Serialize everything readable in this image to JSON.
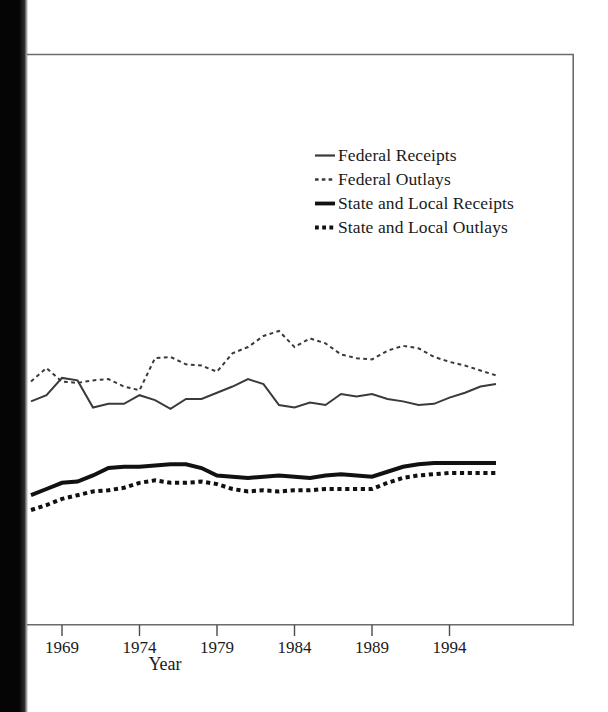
{
  "chart_data": {
    "type": "line",
    "title": "",
    "subtitle": "",
    "xlabel": "Year",
    "ylabel": "",
    "grid": false,
    "legend_position": "upper-center",
    "xlim": [
      1967,
      1998
    ],
    "ylim": [
      0,
      26
    ],
    "x_ticks": [
      1969,
      1974,
      1979,
      1984,
      1989,
      1994
    ],
    "x_tick_labels": [
      "1969",
      "1974",
      "1979",
      "1984",
      "1989",
      "1994"
    ],
    "y_ticks": [],
    "y_tick_labels": [],
    "note": "Y axis is cropped out of the screenshot; values are percent-of-GDP style magnitudes estimated from pixel positions.",
    "x": [
      1967,
      1968,
      1969,
      1970,
      1971,
      1972,
      1973,
      1974,
      1975,
      1976,
      1977,
      1978,
      1979,
      1980,
      1981,
      1982,
      1983,
      1984,
      1985,
      1986,
      1987,
      1988,
      1989,
      1990,
      1991,
      1992,
      1993,
      1994,
      1995,
      1996,
      1997
    ],
    "series": [
      {
        "name": "Federal Receipts",
        "style": "solid",
        "width": "thin",
        "color": "#3a3a3a",
        "values": [
          17.8,
          18.3,
          19.7,
          19.5,
          17.3,
          17.6,
          17.6,
          18.3,
          17.9,
          17.2,
          18.0,
          18.0,
          18.5,
          19.0,
          19.6,
          19.2,
          17.5,
          17.3,
          17.7,
          17.5,
          18.4,
          18.2,
          18.4,
          18.0,
          17.8,
          17.5,
          17.6,
          18.1,
          18.5,
          19.0,
          19.2
        ]
      },
      {
        "name": "Federal Outlays",
        "style": "dotted",
        "width": "thin",
        "color": "#3a3a3a",
        "values": [
          19.4,
          20.5,
          19.4,
          19.3,
          19.5,
          19.6,
          19.0,
          18.7,
          21.3,
          21.4,
          20.8,
          20.7,
          20.2,
          21.7,
          22.2,
          23.1,
          23.5,
          22.2,
          22.9,
          22.5,
          21.6,
          21.3,
          21.2,
          21.9,
          22.3,
          22.1,
          21.4,
          21.0,
          20.7,
          20.3,
          19.9
        ]
      },
      {
        "name": "State and Local Receipts",
        "style": "solid",
        "width": "thick",
        "color": "#111111",
        "values": [
          10.2,
          10.7,
          11.2,
          11.3,
          11.8,
          12.4,
          12.5,
          12.5,
          12.6,
          12.7,
          12.7,
          12.4,
          11.8,
          11.7,
          11.6,
          11.7,
          11.8,
          11.7,
          11.6,
          11.8,
          11.9,
          11.8,
          11.7,
          12.1,
          12.5,
          12.7,
          12.8,
          12.8,
          12.8,
          12.8,
          12.8
        ]
      },
      {
        "name": "State and Local Outlays",
        "style": "dotted",
        "width": "thick",
        "color": "#111111",
        "values": [
          9.0,
          9.4,
          9.9,
          10.2,
          10.5,
          10.6,
          10.8,
          11.2,
          11.4,
          11.2,
          11.2,
          11.3,
          11.1,
          10.7,
          10.5,
          10.6,
          10.5,
          10.6,
          10.6,
          10.7,
          10.7,
          10.7,
          10.7,
          11.2,
          11.6,
          11.8,
          11.9,
          12.0,
          12.0,
          12.0,
          12.0
        ]
      }
    ]
  },
  "legend": {
    "items": [
      {
        "label": "Federal Receipts",
        "style": "solid-thin"
      },
      {
        "label": "Federal Outlays",
        "style": "dotted-thin"
      },
      {
        "label": "State and Local Receipts",
        "style": "solid-thick"
      },
      {
        "label": "State and Local Outlays",
        "style": "dotted-thick"
      }
    ]
  },
  "axis": {
    "x_title": "Year",
    "x_tick_labels": [
      "1969",
      "1974",
      "1979",
      "1984",
      "1989",
      "1994"
    ]
  },
  "colors": {
    "federal": "#3a3a3a",
    "state_local": "#111111",
    "frame": "#6b6b6b",
    "page_background": "#ffffff",
    "scan_band": "#0b0b0b"
  }
}
